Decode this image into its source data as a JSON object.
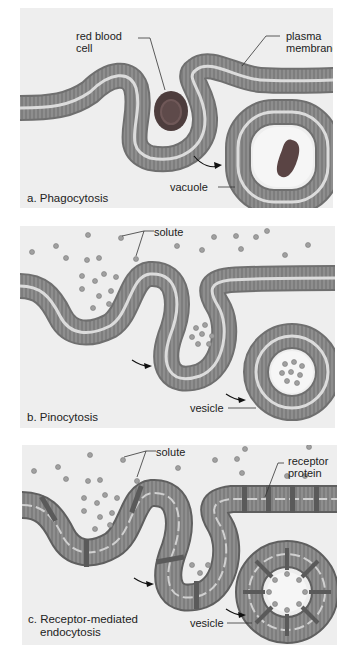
{
  "panels": [
    {
      "id": "a",
      "caption": "a. Phagocytosis",
      "labels": {
        "rbc_line1": "red blood",
        "rbc_line2": "cell",
        "pm_line1": "plasma",
        "pm_line2": "membrane",
        "vacuole": "vacuole"
      }
    },
    {
      "id": "b",
      "caption": "b. Pinocytosis",
      "labels": {
        "solute": "solute",
        "vesicle": "vesicle"
      }
    },
    {
      "id": "c",
      "caption_line1": "c. Receptor-mediated",
      "caption_line2": "endocytosis",
      "labels": {
        "solute": "solute",
        "receptor_line1": "receptor",
        "receptor_line2": "protein",
        "vesicle": "vesicle"
      }
    }
  ],
  "colors": {
    "panel_bg": "#eeeeee",
    "membrane_head": "#7a7a7a",
    "membrane_tail": "#9a9a9a",
    "membrane_core": "#d8d8d8",
    "rbc": "#5a4848",
    "solute": "#9a9a9a",
    "receptor": "#5e5e5e"
  }
}
